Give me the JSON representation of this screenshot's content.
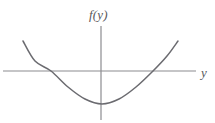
{
  "figure": {
    "background_color": "#ffffff",
    "width": 215,
    "height": 123,
    "vertical_axis_label": "f(y)",
    "horizontal_axis_label": "y"
  },
  "chart_data": {
    "type": "line",
    "title": "",
    "subtitle": "",
    "xlabel": "y",
    "ylabel": "f(y)",
    "curve_label": "f(y)",
    "shape": "upward-opening parabola",
    "grid": false,
    "legend": false,
    "axis_color": "#8c8c90",
    "curve_color": "#6b6b70",
    "axis_line_width": 1.2,
    "curve_line_width": 1.5,
    "origin_px": {
      "x": 101,
      "y": 71
    },
    "horizontal_axis_extent_px": {
      "x1": 3,
      "y1": 71,
      "x2": 196,
      "y2": 71
    },
    "vertical_axis_extent_px": {
      "x1": 101,
      "y1": 26,
      "x2": 101,
      "y2": 120
    },
    "vertex_px": {
      "x": 102,
      "y": 104
    },
    "root_left_px": {
      "x": 51,
      "y": 71
    },
    "root_right_px": {
      "x": 153,
      "y": 71
    },
    "endpoint_left_px": {
      "x": 23,
      "y": 41
    },
    "endpoint_right_px": {
      "x": 178,
      "y": 41
    },
    "x": [
      23,
      35,
      51,
      68,
      85,
      102,
      119,
      136,
      153,
      167,
      178
    ],
    "y": [
      41,
      61,
      71,
      87,
      99,
      104,
      99,
      87,
      71,
      56,
      41
    ],
    "x_units": "pixels (left to right)",
    "y_units": "pixels (top to bottom, screen coords)",
    "curve_path": "M 23 41 Q 37 71 52 88 Q 78 110 102 104 Q 126 110 152 88 Q 167 71 178 41"
  }
}
